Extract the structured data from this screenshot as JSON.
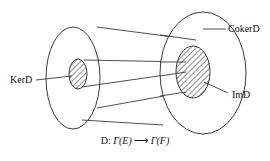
{
  "diagram": {
    "labels": {
      "ker": "KerD",
      "coker": "CokerD",
      "im": "ImD"
    },
    "caption": {
      "map_name": "D:",
      "domain": "Γ(E)",
      "codomain": "Γ(F)",
      "arrow": "⟶"
    },
    "colors": {
      "stroke": "#222222",
      "background": "#ffffff"
    }
  }
}
